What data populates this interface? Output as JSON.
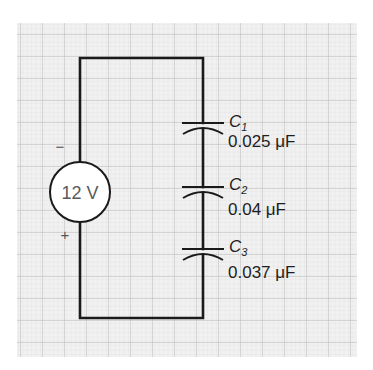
{
  "diagram": {
    "type": "circuit",
    "colors": {
      "background": "#ffffff",
      "grid_fill": "#f0f0f0",
      "grid_minor": "#dcdcdc",
      "grid_major": "#b9b9b9",
      "wire": "#1a1a1a",
      "source_text": "#5a5a5a"
    },
    "source": {
      "label": "12 V",
      "negative_symbol": "−",
      "positive_symbol": "+"
    },
    "capacitors": [
      {
        "name": "C",
        "subscript": "1",
        "value": "0.025 μF"
      },
      {
        "name": "C",
        "subscript": "2",
        "value": "0.04 μF"
      },
      {
        "name": "C",
        "subscript": "3",
        "value": "0.037 μF"
      }
    ]
  }
}
